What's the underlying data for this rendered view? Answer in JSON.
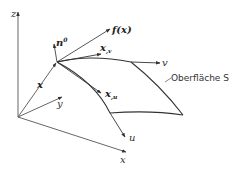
{
  "diagram": {
    "type": "parametric-surface-vector-diagram",
    "axes": {
      "z_label": "z",
      "y_label": "y",
      "x_label": "x"
    },
    "vectors": {
      "position_label": "x",
      "normal_label": "n",
      "normal_superscript": "0",
      "field_label": "f(x)",
      "tangent_v_label": "x",
      "tangent_v_sub": ",v",
      "tangent_u_label": "x",
      "tangent_u_sub": ",u"
    },
    "curves": {
      "v_label": "v",
      "u_label": "u"
    },
    "surface": {
      "label": "Oberfläche S"
    },
    "colors": {
      "line": "#444444",
      "background": "#ffffff"
    }
  }
}
